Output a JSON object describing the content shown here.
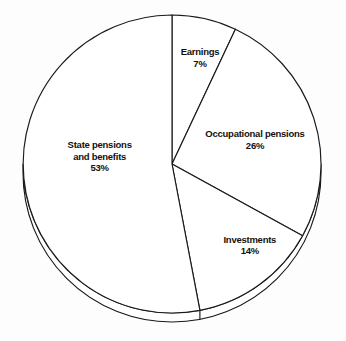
{
  "chart_data": {
    "type": "pie",
    "title": "",
    "subtitle": "",
    "xlabel": "",
    "ylabel": "",
    "legend_position": "none",
    "grid": false,
    "units": "percent",
    "total": 100,
    "start_angle_deg": 0,
    "direction": "clockwise",
    "style": "3d-unfilled-outline",
    "categories": [
      "Earnings",
      "Occupational pensions",
      "Investments",
      "State pensions and benefits"
    ],
    "values": [
      7,
      26,
      14,
      53
    ],
    "slices": [
      {
        "label": "Earnings",
        "label_lines": [
          "Earnings"
        ],
        "value": 7,
        "value_text": "7%",
        "start_deg": 0,
        "end_deg": 25.2,
        "label_x_pct": 57.8,
        "label_y_pct": 16.8
      },
      {
        "label": "Occupational pensions",
        "label_lines": [
          "Occupational pensions"
        ],
        "value": 26,
        "value_text": "26%",
        "start_deg": 25.2,
        "end_deg": 118.8,
        "label_x_pct": 73.7,
        "label_y_pct": 40.8
      },
      {
        "label": "Investments",
        "label_lines": [
          "Investments"
        ],
        "value": 14,
        "value_text": "14%",
        "start_deg": 118.8,
        "end_deg": 169.2,
        "label_x_pct": 72.2,
        "label_y_pct": 71.8
      },
      {
        "label": "State pensions and benefits",
        "label_lines": [
          "State pensions",
          "and benefits"
        ],
        "value": 53,
        "value_text": "53%",
        "start_deg": 169.2,
        "end_deg": 360,
        "label_x_pct": 28.8,
        "label_y_pct": 45.8
      }
    ],
    "colors": {
      "background": "#fdfdfd",
      "slice_fill": "#ffffff",
      "outline": "#1a1a1a",
      "label_text": "#111111"
    },
    "geometry": {
      "center_x": 172,
      "center_y": 164,
      "radius": 149,
      "depth": 9
    }
  }
}
